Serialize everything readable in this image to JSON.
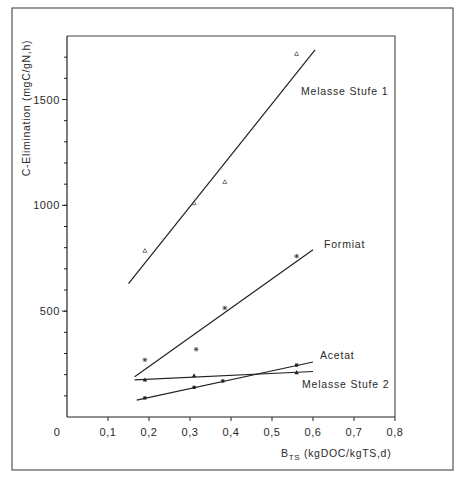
{
  "chart_data": {
    "type": "scatter",
    "title": "",
    "xlabel": "B_TS (kgDOC/kgTS,d)",
    "xlabel_main": "B",
    "xlabel_sub": "TS",
    "xlabel_rest": " (kgDOC/kgTS,d)",
    "ylabel": "C-Elimination (mgC/gN,h)",
    "xlim": [
      0,
      0.8
    ],
    "ylim": [
      0,
      1800
    ],
    "grid": false,
    "legend_position": "inline labels at line ends",
    "x_ticks": [
      {
        "value": 0,
        "label": "0"
      },
      {
        "value": 0.1,
        "label": "0,1"
      },
      {
        "value": 0.2,
        "label": "0,2"
      },
      {
        "value": 0.3,
        "label": "0,3"
      },
      {
        "value": 0.4,
        "label": "0,4"
      },
      {
        "value": 0.5,
        "label": "0,5"
      },
      {
        "value": 0.6,
        "label": "0,6"
      },
      {
        "value": 0.7,
        "label": "0,7"
      },
      {
        "value": 0.8,
        "label": "0,8"
      }
    ],
    "y_ticks": [
      {
        "value": 500,
        "label": "500"
      },
      {
        "value": 1000,
        "label": "1000"
      },
      {
        "value": 1500,
        "label": "1500"
      }
    ],
    "y_minor_tick_step": 100,
    "series": [
      {
        "name": "Melasse Stufe 1",
        "marker": "open-triangle",
        "points": [
          [
            0.19,
            785
          ],
          [
            0.31,
            1010
          ],
          [
            0.385,
            1110
          ],
          [
            0.56,
            1715
          ]
        ],
        "fit_line": [
          [
            0.15,
            630
          ],
          [
            0.605,
            1735
          ]
        ]
      },
      {
        "name": "Formiat",
        "marker": "asterisk",
        "points": [
          [
            0.19,
            270
          ],
          [
            0.315,
            320
          ],
          [
            0.385,
            515
          ],
          [
            0.56,
            760
          ]
        ],
        "fit_line": [
          [
            0.165,
            190
          ],
          [
            0.6,
            790
          ]
        ]
      },
      {
        "name": "Acetat",
        "marker": "filled-circle",
        "points": [
          [
            0.19,
            90
          ],
          [
            0.31,
            140
          ],
          [
            0.38,
            170
          ],
          [
            0.56,
            245
          ]
        ],
        "fit_line": [
          [
            0.17,
            80
          ],
          [
            0.6,
            260
          ]
        ]
      },
      {
        "name": "Melasse Stufe 2",
        "marker": "filled-triangle",
        "points": [
          [
            0.19,
            175
          ],
          [
            0.31,
            195
          ],
          [
            0.56,
            210
          ]
        ],
        "fit_line": [
          [
            0.165,
            175
          ],
          [
            0.6,
            215
          ]
        ]
      }
    ]
  }
}
